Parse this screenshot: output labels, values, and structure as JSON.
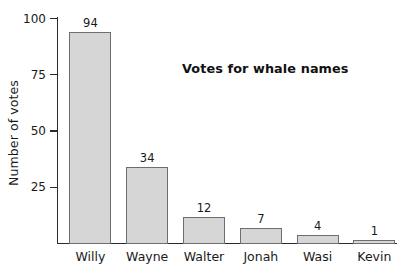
{
  "chart_data": {
    "type": "bar",
    "title": "Votes for whale names",
    "xlabel": "",
    "ylabel": "Number of votes",
    "categories": [
      "Willy",
      "Wayne",
      "Walter",
      "Jonah",
      "Wasi",
      "Kevin"
    ],
    "values": [
      94,
      34,
      12,
      7,
      4,
      1
    ],
    "value_labels": [
      "94",
      "34",
      "12",
      "7",
      "4",
      "1"
    ],
    "ylim": [
      0,
      100
    ],
    "yticks": [
      25,
      50,
      75,
      100
    ],
    "ytick_labels": [
      "25",
      "50",
      "75",
      "100"
    ],
    "grid": false,
    "legend": false,
    "bar_fill_color": "#d6d6d6",
    "bar_border_color": "#6e6e6e",
    "axis_color": "#2b2b2b",
    "text_color": "#1a1a1a",
    "background_color": "#ffffff"
  }
}
